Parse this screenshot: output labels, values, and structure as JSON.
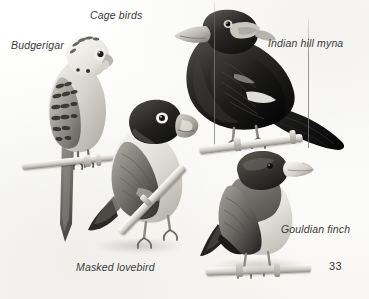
{
  "plate": {
    "title": "Cage birds",
    "page_number": "33",
    "medium": "grayscale illustration plate",
    "background_color": "#fdfdfc",
    "ink_color": "#3a3a38"
  },
  "labels": [
    {
      "id": "plate-title",
      "text": "Cage birds",
      "x": 90,
      "y": 10
    },
    {
      "id": "budgerigar",
      "text": "Budgerigar",
      "x": 11,
      "y": 40
    },
    {
      "id": "indian-hill-myna",
      "text": "Indian hill myna",
      "x": 268,
      "y": 38
    },
    {
      "id": "gouldian-finch",
      "text": "Gouldian finch",
      "x": 281,
      "y": 224
    },
    {
      "id": "masked-lovebird",
      "text": "Masked lovebird",
      "x": 76,
      "y": 262
    }
  ],
  "specimens": [
    {
      "id": "budgerigar",
      "common_name": "Budgerigar",
      "label_text": "Budgerigar",
      "position": "upper-left",
      "perched": true,
      "long_tail": true
    },
    {
      "id": "indian-hill-myna",
      "common_name": "Indian hill myna",
      "label_text": "Indian hill myna",
      "position": "upper-right",
      "perched": true,
      "long_tail": false
    },
    {
      "id": "masked-lovebird",
      "common_name": "Masked lovebird",
      "label_text": "Masked lovebird",
      "position": "lower-left-centre",
      "perched": true,
      "long_tail": false
    },
    {
      "id": "gouldian-finch",
      "common_name": "Gouldian finch",
      "label_text": "Gouldian finch",
      "position": "lower-right",
      "perched": true,
      "long_tail": false
    }
  ]
}
